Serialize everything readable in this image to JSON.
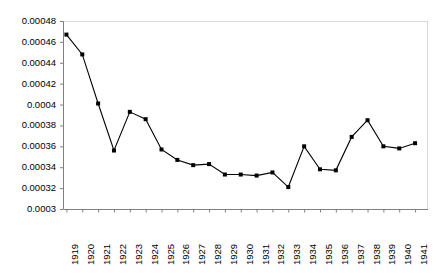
{
  "chart_data": {
    "type": "line",
    "title": "",
    "xlabel": "",
    "ylabel": "",
    "categories": [
      "1919",
      "1920",
      "1921",
      "1922",
      "1923",
      "1924",
      "1925",
      "1926",
      "1927",
      "1928",
      "1929",
      "1930",
      "1931",
      "1932",
      "1933",
      "1934",
      "1935",
      "1936",
      "1937",
      "1938",
      "1939",
      "1940",
      "1941"
    ],
    "values": [
      0.000467,
      0.000448,
      0.000401,
      0.000356,
      0.000393,
      0.000386,
      0.000357,
      0.000347,
      0.000342,
      0.000343,
      0.000333,
      0.000333,
      0.000332,
      0.000335,
      0.000321,
      0.00036,
      0.000338,
      0.000337,
      0.000369,
      0.000385,
      0.00036,
      0.000358,
      0.000363
    ],
    "ylim": [
      0.0003,
      0.00048
    ],
    "ytick_step": 2e-05,
    "ytick_labels": [
      "0.00048",
      "0.00046",
      "0.00044",
      "0.00042",
      "0.0004",
      "0.00038",
      "0.00036",
      "0.00034",
      "0.00032",
      "0.0003"
    ],
    "ytick_values": [
      0.00048,
      0.00046,
      0.00044,
      0.00042,
      0.0004,
      0.00038,
      0.00036,
      0.00034,
      0.00032,
      0.0003
    ],
    "grid": false,
    "legend": null,
    "legend_position": "none",
    "series_color": "#000000",
    "marker": "square",
    "axis_color": "#808080",
    "xtick_labels_rotated": true
  }
}
